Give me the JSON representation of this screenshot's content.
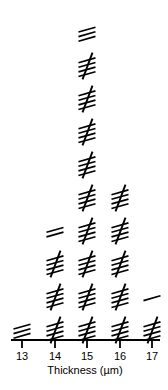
{
  "chart_data": {
    "type": "bar",
    "render_style": "tally-marks",
    "title": "",
    "subtitle": "",
    "xlabel": "Thickness (µm)",
    "ylabel": "",
    "categories": [
      "13",
      "14",
      "15",
      "16",
      "17"
    ],
    "values": [
      3,
      17,
      48,
      25,
      6
    ],
    "tick_labels": [
      "13",
      "14",
      "15",
      "16",
      "17"
    ],
    "xlim": [
      12.5,
      17.5
    ],
    "ylim": [
      0,
      50
    ],
    "grid": false,
    "legend": null,
    "annotations": [],
    "marks_per_group": 5,
    "groups": [
      {
        "category": "13",
        "full_groups": 0,
        "remainder": 3
      },
      {
        "category": "14",
        "full_groups": 3,
        "remainder": 2
      },
      {
        "category": "15",
        "full_groups": 9,
        "remainder": 3
      },
      {
        "category": "16",
        "full_groups": 5,
        "remainder": 0
      },
      {
        "category": "17",
        "full_groups": 1,
        "remainder": 1
      }
    ],
    "colors": {
      "mark": "#000000",
      "axis": "#000000",
      "background": "#ffffff"
    }
  },
  "axis": {
    "title": "Thickness (µm)",
    "ticks": [
      "13",
      "14",
      "15",
      "16",
      "17"
    ]
  }
}
